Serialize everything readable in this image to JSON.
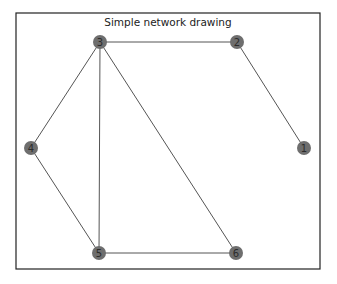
{
  "title": "Simple network drawing",
  "colors": {
    "node_fill": "#6e6e6e",
    "edge": "#555555",
    "label": "#2b2b2b",
    "frame": "#222222",
    "background": "#ffffff"
  },
  "frame": {
    "x": 16,
    "y": 13,
    "width": 304,
    "height": 256
  },
  "nodes": [
    {
      "id": "1",
      "label": "1",
      "x": 304,
      "y": 148
    },
    {
      "id": "2",
      "label": "2",
      "x": 237,
      "y": 42
    },
    {
      "id": "3",
      "label": "3",
      "x": 100,
      "y": 42
    },
    {
      "id": "4",
      "label": "4",
      "x": 31,
      "y": 148
    },
    {
      "id": "5",
      "label": "5",
      "x": 99,
      "y": 253
    },
    {
      "id": "6",
      "label": "6",
      "x": 236,
      "y": 253
    }
  ],
  "edges": [
    {
      "source": "3",
      "target": "2"
    },
    {
      "source": "2",
      "target": "1"
    },
    {
      "source": "3",
      "target": "4"
    },
    {
      "source": "3",
      "target": "5"
    },
    {
      "source": "3",
      "target": "6"
    },
    {
      "source": "4",
      "target": "5"
    },
    {
      "source": "5",
      "target": "6"
    }
  ],
  "node_radius": 7
}
